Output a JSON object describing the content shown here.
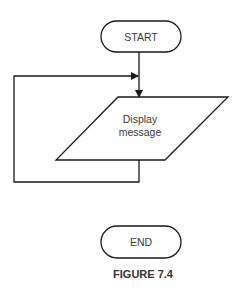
{
  "diagram": {
    "type": "flowchart",
    "nodes": {
      "start": {
        "shape": "terminator",
        "label": "START"
      },
      "display": {
        "shape": "parallelogram",
        "label_line1": "Display",
        "label_line2": "message"
      },
      "end": {
        "shape": "terminator",
        "label": "END"
      }
    },
    "edges": [
      {
        "from": "start",
        "to": "display"
      },
      {
        "from": "display",
        "to": "display",
        "kind": "loop-back"
      }
    ],
    "caption": "FIGURE 7.4"
  },
  "colors": {
    "stroke": "#1a1a1a",
    "text": "#3a3a3a",
    "background": "#ffffff"
  }
}
